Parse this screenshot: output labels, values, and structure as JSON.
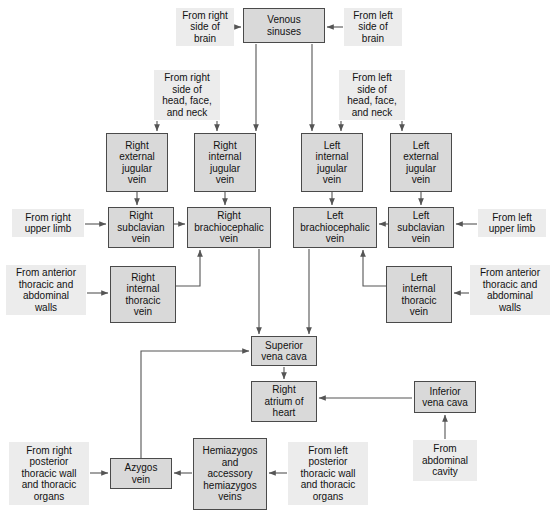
{
  "diagram": {
    "type": "flowchart",
    "box_fill": "#d9d9d9",
    "box_border": "#4a4a4a",
    "source_fill": "#ececec",
    "connector_color": "#555555",
    "background": "#ffffff"
  },
  "nodes": [
    {
      "id": "venous_sinuses",
      "label": "Venous\nsinuses",
      "kind": "vessel",
      "x": 243,
      "y": 8,
      "w": 82,
      "h": 35
    },
    {
      "id": "right_external_jugular",
      "label": "Right\nexternal\njugular\nvein",
      "kind": "vessel",
      "x": 106,
      "y": 133,
      "w": 62,
      "h": 59
    },
    {
      "id": "right_internal_jugular",
      "label": "Right\ninternal\njugular\nvein",
      "kind": "vessel",
      "x": 194,
      "y": 133,
      "w": 62,
      "h": 59
    },
    {
      "id": "left_internal_jugular",
      "label": "Left\ninternal\njugular\nvein",
      "kind": "vessel",
      "x": 301,
      "y": 133,
      "w": 62,
      "h": 59
    },
    {
      "id": "left_external_jugular",
      "label": "Left\nexternal\njugular\nvein",
      "kind": "vessel",
      "x": 390,
      "y": 133,
      "w": 62,
      "h": 59
    },
    {
      "id": "right_subclavian",
      "label": "Right\nsubclavian\nvein",
      "kind": "vessel",
      "x": 108,
      "y": 207,
      "w": 66,
      "h": 41
    },
    {
      "id": "right_brachiocephalic",
      "label": "Right\nbrachiocephalic\nvein",
      "kind": "vessel",
      "x": 187,
      "y": 207,
      "w": 84,
      "h": 41
    },
    {
      "id": "left_brachiocephalic",
      "label": "Left\nbrachiocephalic\nvein",
      "kind": "vessel",
      "x": 293,
      "y": 207,
      "w": 84,
      "h": 41
    },
    {
      "id": "left_subclavian",
      "label": "Left\nsubclavian\nvein",
      "kind": "vessel",
      "x": 388,
      "y": 207,
      "w": 66,
      "h": 41
    },
    {
      "id": "right_internal_thoracic",
      "label": "Right\ninternal\nthoracic\nvein",
      "kind": "vessel",
      "x": 110,
      "y": 266,
      "w": 66,
      "h": 57
    },
    {
      "id": "left_internal_thoracic",
      "label": "Left\ninternal\nthoracic\nvein",
      "kind": "vessel",
      "x": 386,
      "y": 266,
      "w": 66,
      "h": 57
    },
    {
      "id": "superior_vena_cava",
      "label": "Superior\nvena cava",
      "kind": "vessel",
      "x": 251,
      "y": 336,
      "w": 66,
      "h": 30
    },
    {
      "id": "right_atrium",
      "label": "Right\natrium of\nheart",
      "kind": "vessel",
      "x": 251,
      "y": 381,
      "w": 66,
      "h": 41
    },
    {
      "id": "inferior_vena_cava",
      "label": "Inferior\nvena cava",
      "kind": "vessel",
      "x": 414,
      "y": 381,
      "w": 62,
      "h": 32
    },
    {
      "id": "azygos_vein",
      "label": "Azygos\nvein",
      "kind": "vessel",
      "x": 110,
      "y": 458,
      "w": 62,
      "h": 31
    },
    {
      "id": "hemiazygos_veins",
      "label": "Hemiazygos\nand\naccessory\nhemiazygos\nveins",
      "kind": "vessel",
      "x": 193,
      "y": 438,
      "w": 74,
      "h": 72
    }
  ],
  "sources": [
    {
      "id": "from_right_brain",
      "label": "From right\nside of\nbrain",
      "x": 176,
      "y": 8,
      "w": 58,
      "h": 38
    },
    {
      "id": "from_left_brain",
      "label": "From left\nside of\nbrain",
      "x": 344,
      "y": 8,
      "w": 58,
      "h": 38
    },
    {
      "id": "from_right_head_face_neck",
      "label": "From right\nside of\nhead, face,\nand neck",
      "x": 154,
      "y": 70,
      "w": 66,
      "h": 50
    },
    {
      "id": "from_left_head_face_neck",
      "label": "From left\nside of\nhead, face,\nand neck",
      "x": 339,
      "y": 70,
      "w": 66,
      "h": 50
    },
    {
      "id": "from_right_upper_limb",
      "label": "From right\nupper limb",
      "x": 12,
      "y": 209,
      "w": 72,
      "h": 28
    },
    {
      "id": "from_left_upper_limb",
      "label": "From left\nupper limb",
      "x": 478,
      "y": 209,
      "w": 68,
      "h": 28
    },
    {
      "id": "from_anterior_thoracic_right",
      "label": "From anterior\nthoracic and\nabdominal\nwalls",
      "x": 6,
      "y": 265,
      "w": 80,
      "h": 50
    },
    {
      "id": "from_anterior_thoracic_left",
      "label": "From anterior\nthoracic and\nabdominal\nwalls",
      "x": 470,
      "y": 265,
      "w": 80,
      "h": 50
    },
    {
      "id": "from_abdominal_cavity",
      "label": "From\nabdominal\ncavity",
      "x": 413,
      "y": 440,
      "w": 64,
      "h": 41
    },
    {
      "id": "from_right_posterior_thoracic",
      "label": "From right\nposterior\nthoracic wall\nand thoracic\norgans",
      "x": 9,
      "y": 442,
      "w": 80,
      "h": 63
    },
    {
      "id": "from_left_posterior_thoracic",
      "label": "From left\nposterior\nthoracic wall\nand thoracic\norgans",
      "x": 288,
      "y": 442,
      "w": 80,
      "h": 63
    }
  ],
  "connections": [
    {
      "from": "from_right_brain",
      "to": "venous_sinuses",
      "label": ""
    },
    {
      "from": "from_left_brain",
      "to": "venous_sinuses",
      "label": ""
    },
    {
      "from": "venous_sinuses",
      "to": "right_internal_jugular",
      "label": ""
    },
    {
      "from": "venous_sinuses",
      "to": "left_internal_jugular",
      "label": ""
    },
    {
      "from": "from_right_head_face_neck",
      "to": "right_external_jugular",
      "label": ""
    },
    {
      "from": "from_right_head_face_neck",
      "to": "right_internal_jugular",
      "label": ""
    },
    {
      "from": "from_left_head_face_neck",
      "to": "left_internal_jugular",
      "label": ""
    },
    {
      "from": "from_left_head_face_neck",
      "to": "left_external_jugular",
      "label": ""
    },
    {
      "from": "right_external_jugular",
      "to": "right_subclavian",
      "label": ""
    },
    {
      "from": "right_internal_jugular",
      "to": "right_brachiocephalic",
      "label": ""
    },
    {
      "from": "left_internal_jugular",
      "to": "left_brachiocephalic",
      "label": ""
    },
    {
      "from": "left_external_jugular",
      "to": "left_subclavian",
      "label": ""
    },
    {
      "from": "from_right_upper_limb",
      "to": "right_subclavian",
      "label": ""
    },
    {
      "from": "right_subclavian",
      "to": "right_brachiocephalic",
      "label": ""
    },
    {
      "from": "from_left_upper_limb",
      "to": "left_subclavian",
      "label": ""
    },
    {
      "from": "left_subclavian",
      "to": "left_brachiocephalic",
      "label": ""
    },
    {
      "from": "from_anterior_thoracic_right",
      "to": "right_internal_thoracic",
      "label": ""
    },
    {
      "from": "right_internal_thoracic",
      "to": "right_brachiocephalic",
      "label": ""
    },
    {
      "from": "from_anterior_thoracic_left",
      "to": "left_internal_thoracic",
      "label": ""
    },
    {
      "from": "left_internal_thoracic",
      "to": "left_brachiocephalic",
      "label": ""
    },
    {
      "from": "right_brachiocephalic",
      "to": "superior_vena_cava",
      "label": ""
    },
    {
      "from": "left_brachiocephalic",
      "to": "superior_vena_cava",
      "label": ""
    },
    {
      "from": "azygos_vein",
      "to": "superior_vena_cava",
      "label": ""
    },
    {
      "from": "superior_vena_cava",
      "to": "right_atrium",
      "label": ""
    },
    {
      "from": "inferior_vena_cava",
      "to": "right_atrium",
      "label": ""
    },
    {
      "from": "from_abdominal_cavity",
      "to": "inferior_vena_cava",
      "label": ""
    },
    {
      "from": "from_right_posterior_thoracic",
      "to": "azygos_vein",
      "label": ""
    },
    {
      "from": "hemiazygos_veins",
      "to": "azygos_vein",
      "label": ""
    },
    {
      "from": "from_left_posterior_thoracic",
      "to": "hemiazygos_veins",
      "label": ""
    }
  ]
}
